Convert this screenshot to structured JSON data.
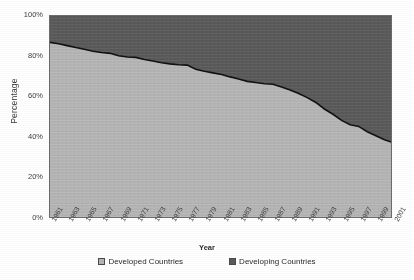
{
  "chart_data": {
    "type": "area",
    "title": "",
    "subtitle": "",
    "xlabel": "Year",
    "ylabel": "Percentage",
    "stacked": true,
    "stack_total": 100,
    "grid": false,
    "legend_position": "bottom",
    "xlim": [
      1961,
      2001
    ],
    "ylim": [
      0,
      100
    ],
    "ytick_labels": [
      "0%",
      "20%",
      "40%",
      "60%",
      "80%",
      "100%"
    ],
    "ytick_values": [
      0,
      20,
      40,
      60,
      80,
      100
    ],
    "xtick_labels": [
      "1961",
      "1963",
      "1965",
      "1967",
      "1969",
      "1971",
      "1973",
      "1975",
      "1977",
      "1979",
      "1981",
      "1983",
      "1985",
      "1987",
      "1989",
      "1991",
      "1993",
      "1995",
      "1997",
      "1999",
      "2001"
    ],
    "x": [
      1961,
      1962,
      1963,
      1964,
      1965,
      1966,
      1967,
      1968,
      1969,
      1970,
      1971,
      1972,
      1973,
      1974,
      1975,
      1976,
      1977,
      1978,
      1979,
      1980,
      1981,
      1982,
      1983,
      1984,
      1985,
      1986,
      1987,
      1988,
      1989,
      1990,
      1991,
      1992,
      1993,
      1994,
      1995,
      1996,
      1997,
      1998,
      1999,
      2000,
      2001
    ],
    "series": [
      {
        "name": "Developed Countries",
        "color": "#b4b4b4",
        "values": [
          87.0,
          86.3,
          85.4,
          84.5,
          83.6,
          82.6,
          82.0,
          81.6,
          80.4,
          79.8,
          79.6,
          78.6,
          77.8,
          77.0,
          76.4,
          76.0,
          75.8,
          73.8,
          72.8,
          72.0,
          71.2,
          70.0,
          69.0,
          67.8,
          67.2,
          66.6,
          66.4,
          65.0,
          63.6,
          61.8,
          59.8,
          57.4,
          54.2,
          51.6,
          48.6,
          46.4,
          45.6,
          43.0,
          41.0,
          39.0,
          37.6
        ]
      },
      {
        "name": "Developing Countries",
        "color": "#5a5a5a",
        "values": [
          13.0,
          13.7,
          14.6,
          15.5,
          16.4,
          17.4,
          18.0,
          18.4,
          19.6,
          20.2,
          20.4,
          21.4,
          22.2,
          23.0,
          23.6,
          24.0,
          24.2,
          26.2,
          27.2,
          28.0,
          28.8,
          30.0,
          31.0,
          32.2,
          32.8,
          33.4,
          33.6,
          35.0,
          36.4,
          38.2,
          40.2,
          42.6,
          45.8,
          48.4,
          51.4,
          53.6,
          54.4,
          57.0,
          59.0,
          61.0,
          62.4
        ]
      }
    ]
  },
  "legend": {
    "items": [
      {
        "label": "Developed Countries",
        "color": "#b4b4b4"
      },
      {
        "label": "Developing Countries",
        "color": "#5a5a5a"
      }
    ]
  }
}
